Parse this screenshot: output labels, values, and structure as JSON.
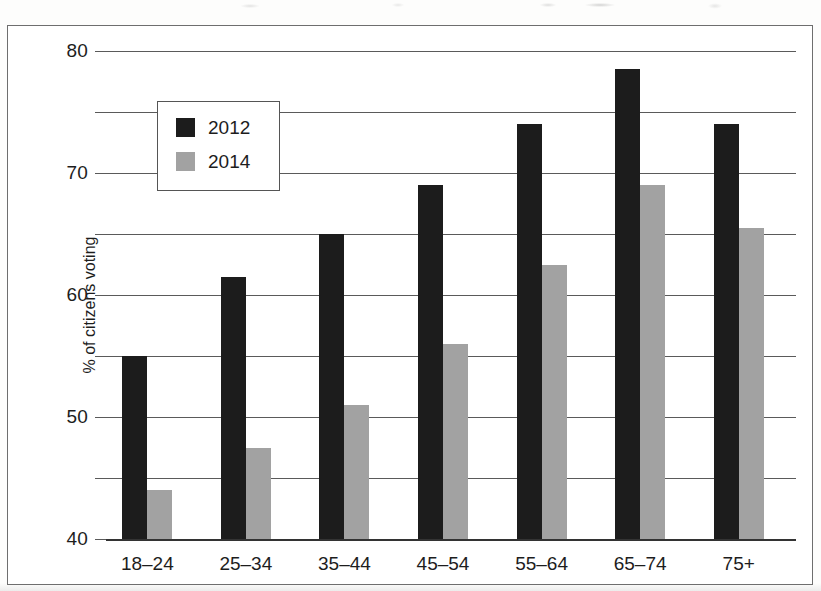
{
  "figure": {
    "frame_visible": true,
    "background_color": "#ffffff"
  },
  "legend": {
    "position": "inside-top-left",
    "entries": [
      {
        "label": "2012",
        "color": "#1c1c1c",
        "swatch": "filled-square-icon"
      },
      {
        "label": "2014",
        "color": "#a2a2a2",
        "swatch": "filled-square-icon"
      }
    ]
  },
  "axes": {
    "y": {
      "label": "% of citizens voting",
      "ticks": [
        "80",
        "70",
        "60",
        "50",
        "40",
        "30",
        "20",
        "10",
        "0"
      ],
      "min": 0,
      "max": 80,
      "step": 10,
      "gridlines": true
    },
    "x": {
      "label": "",
      "ticks": [
        "18–24",
        "25–34",
        "35–44",
        "45–54",
        "55–64",
        "65–74",
        "75+"
      ]
    }
  },
  "chart_data": {
    "type": "bar",
    "title": "",
    "subtitle": "",
    "xlabel": "",
    "ylabel": "% of citizens voting",
    "ylim": [
      0,
      80
    ],
    "ytick_step": 10,
    "grid": true,
    "legend_position": "upper left (inside plot)",
    "categories": [
      "18–24",
      "25–34",
      "35–44",
      "45–54",
      "55–64",
      "65–74",
      "75+"
    ],
    "series": [
      {
        "name": "2012",
        "color": "#1c1c1c",
        "values": [
          30,
          43,
          50,
          58,
          68,
          77,
          68
        ]
      },
      {
        "name": "2014",
        "color": "#a2a2a2",
        "values": [
          8,
          15,
          22,
          32,
          45,
          58,
          51
        ]
      }
    ]
  }
}
